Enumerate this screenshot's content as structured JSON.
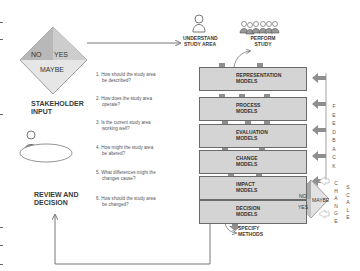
{
  "stakeholder": {
    "diamond": {
      "no": "NO",
      "yes": "YES",
      "maybe": "MAYBE"
    },
    "label_line1": "STAKEHOLDER",
    "label_line2": "INPUT"
  },
  "review": {
    "label_line1": "REVIEW AND",
    "label_line2": "DECISION"
  },
  "top": {
    "understand_line1": "UNDERSTAND",
    "understand_line2": "STUDY AREA",
    "perform_line1": "PERFORM",
    "perform_line2": "STUDY"
  },
  "questions": [
    {
      "num": "1.",
      "line1": "How should the study area",
      "line2": "be described?"
    },
    {
      "num": "2.",
      "line1": "How does the study area",
      "line2": "operate?"
    },
    {
      "num": "3.",
      "line1": "Is the current study area",
      "line2": "working well?"
    },
    {
      "num": "4.",
      "line1": "How might the study area",
      "line2": "be altered?"
    },
    {
      "num": "5.",
      "line1": "What differences might the",
      "line2": "changes cause?"
    },
    {
      "num": "6.",
      "line1": "How should the study area",
      "line2": "be changed?"
    }
  ],
  "models": [
    {
      "line1": "REPRESENTATION",
      "line2": "MODELS"
    },
    {
      "line1": "PROCESS",
      "line2": "MODELS"
    },
    {
      "line1": "EVALUATION",
      "line2": "MODELS"
    },
    {
      "line1": "CHANGE",
      "line2": "MODELS"
    },
    {
      "line1": "IMPACT",
      "line2": "MODELS"
    },
    {
      "line1": "DECISION",
      "line2": "MODELS"
    }
  ],
  "specify": {
    "line1": "SPECIFY",
    "line2": "METHODS"
  },
  "feedback": [
    "F",
    "E",
    "E",
    "D",
    "B",
    "A",
    "C",
    "K"
  ],
  "change_letters": [
    "C",
    "H",
    "A",
    "N",
    "G",
    "E"
  ],
  "scale_letters": [
    "S",
    "C",
    "A",
    "L",
    "E"
  ],
  "decision_diamond": {
    "no": "NO",
    "yes": "YES",
    "maybe": "MAYBE"
  },
  "colors": {
    "box_fill": "#d4d4d4",
    "arrow_fill": "#8f8f8f",
    "line": "#777777",
    "diamond_light": "#e4e4e4",
    "diamond_mid": "#c2c2c2",
    "diamond_dark": "#a8a8a8"
  }
}
